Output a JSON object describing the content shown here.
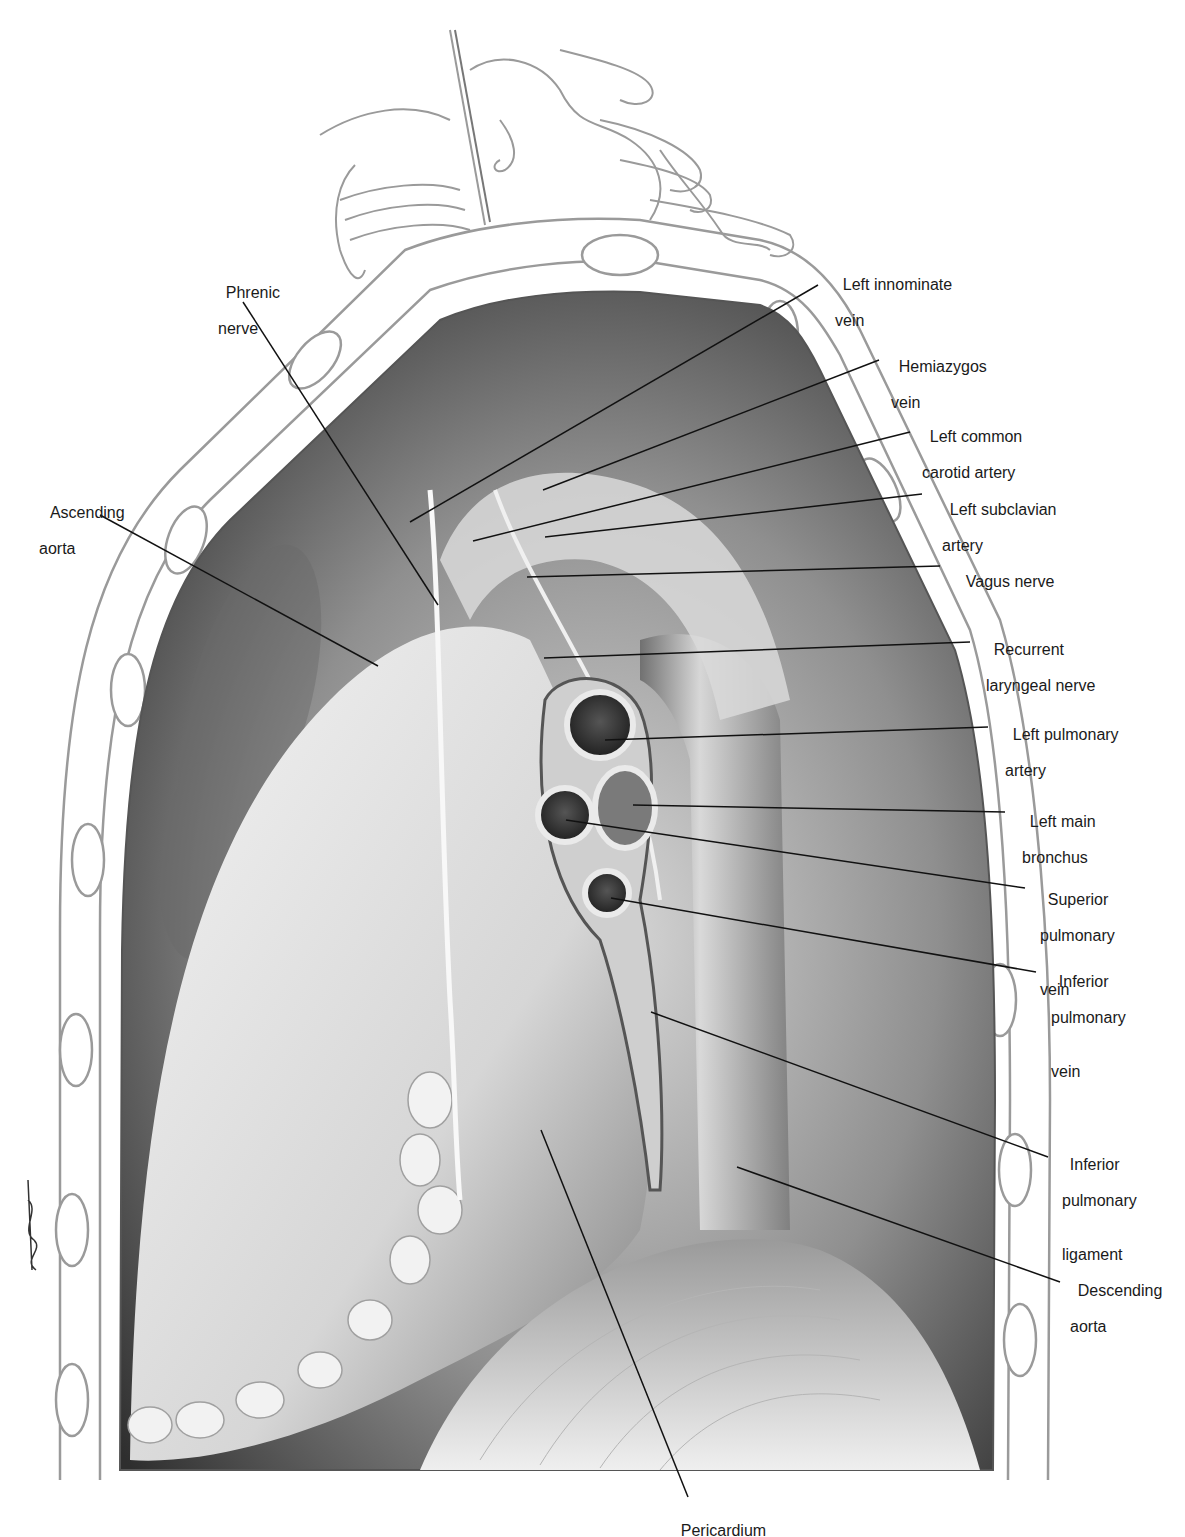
{
  "figure": {
    "signature": "signature"
  },
  "labels": [
    {
      "id": "phrenic-nerve",
      "line1": "Phrenic",
      "line2": "nerve",
      "x": 208,
      "y": 266,
      "line": [
        243,
        302,
        438,
        605
      ]
    },
    {
      "id": "left-innominate-vein",
      "line1": "Left innominate",
      "line2": "vein",
      "x": 825,
      "y": 258,
      "line": [
        818,
        285,
        410,
        522
      ]
    },
    {
      "id": "hemiazygos-vein",
      "line1": "Hemiazygos",
      "line2": "vein",
      "x": 881,
      "y": 340,
      "line": [
        879,
        360,
        543,
        490
      ]
    },
    {
      "id": "left-common-carotid-artery",
      "line1": "Left common",
      "line2": "carotid artery",
      "x": 912,
      "y": 410,
      "line": [
        910,
        432,
        473,
        541
      ]
    },
    {
      "id": "left-subclavian-artery",
      "line1": "Left subclavian",
      "line2": "artery",
      "x": 932,
      "y": 483,
      "line": [
        922,
        494,
        545,
        537
      ]
    },
    {
      "id": "vagus-nerve",
      "line1": "Vagus nerve",
      "line2": "",
      "x": 948,
      "y": 555,
      "line": [
        940,
        566,
        527,
        577
      ]
    },
    {
      "id": "recurrent-laryngeal-nerve",
      "line1": "Recurrent",
      "line2": "laryngeal nerve",
      "x": 976,
      "y": 623,
      "line": [
        970,
        642,
        544,
        658
      ]
    },
    {
      "id": "left-pulmonary-artery",
      "line1": "Left pulmonary",
      "line2": "artery",
      "x": 995,
      "y": 708,
      "line": [
        988,
        727,
        605,
        740
      ]
    },
    {
      "id": "left-main-bronchus",
      "line1": "Left main",
      "line2": "bronchus",
      "x": 1012,
      "y": 795,
      "line": [
        1005,
        812,
        633,
        805
      ]
    },
    {
      "id": "superior-pulmonary-vein",
      "line1": "Superior",
      "line2": "pulmonary",
      "line3": "vein",
      "x": 1030,
      "y": 873,
      "line": [
        1025,
        888,
        566,
        820
      ]
    },
    {
      "id": "inferior-pulmonary-vein",
      "line1": "Inferior",
      "line2": "pulmonary",
      "line3": "vein",
      "x": 1041,
      "y": 955,
      "line": [
        1036,
        972,
        611,
        898
      ]
    },
    {
      "id": "inferior-pulmonary-ligament",
      "line1": "Inferior",
      "line2": "pulmonary",
      "line3": "ligament",
      "x": 1052,
      "y": 1138,
      "line": [
        1048,
        1157,
        651,
        1012
      ]
    },
    {
      "id": "descending-aorta",
      "line1": "Descending",
      "line2": "aorta",
      "x": 1060,
      "y": 1264,
      "line": [
        1060,
        1282,
        737,
        1167
      ]
    },
    {
      "id": "ascending-aorta",
      "line1": "Ascending",
      "line2": "aorta",
      "x": 33,
      "y": 486,
      "line": [
        100,
        515,
        378,
        666
      ],
      "align": "left"
    },
    {
      "id": "pericardium",
      "line1": "Pericardium",
      "line2": "",
      "x": 663,
      "y": 1504,
      "line": [
        688,
        1497,
        541,
        1130
      ],
      "align": "center"
    }
  ],
  "colors": {
    "background": "#ffffff",
    "text": "#1a1a1a",
    "leader": "#111111",
    "outline": "#9a9a9a",
    "cavity_dark": "#3d3d3d",
    "cavity_mid": "#8a8a8a",
    "heart_light": "#e8e8e8",
    "diaphragm": "#cfcfcf"
  }
}
